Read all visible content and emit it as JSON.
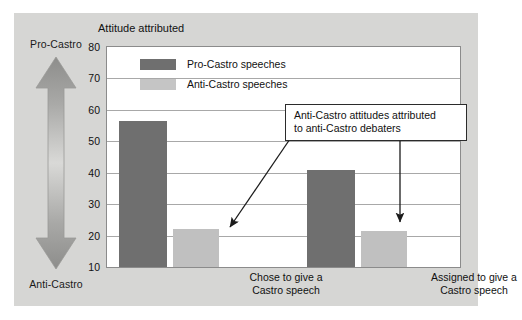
{
  "chart_data": {
    "type": "bar",
    "title": "Attitude attributed",
    "xlabel": "",
    "ylabel": "Attitude attributed",
    "ylim": [
      10,
      80
    ],
    "yticks": [
      10,
      20,
      30,
      40,
      50,
      60,
      70,
      80
    ],
    "grid": true,
    "legend_position": "top-left-inside",
    "categories": [
      "Chose to give a\nCastro speech",
      "Assigned to give a\nCastro speech"
    ],
    "category_lines": [
      [
        "Chose to give a",
        "Castro speech"
      ],
      [
        "Assigned to give a",
        "Castro speech"
      ]
    ],
    "series": [
      {
        "name": "Pro-Castro speeches",
        "color": "#6f6f6f",
        "values": [
          56.5,
          41.0
        ]
      },
      {
        "name": "Anti-Castro speeches",
        "color": "#c0c0c0",
        "values": [
          22.0,
          21.5
        ]
      }
    ],
    "annotations": [
      {
        "text": "Anti-Castro attitudes attributed to anti-Castro debaters",
        "lines": [
          "Anti-Castro attitudes attributed",
          "to anti-Castro debaters"
        ],
        "points_to": [
          "Anti-Castro speeches / Chose to give a Castro speech",
          "Anti-Castro speeches / Assigned to give a Castro speech"
        ]
      }
    ],
    "axis_arrow": {
      "top_label": "Pro-Castro",
      "bottom_label": "Anti-Castro"
    }
  },
  "colors": {
    "panel_background": "#d6d6d4",
    "plot_background": "#ffffff",
    "series_dark": "#6f6f6f",
    "series_light": "#c0c0c0",
    "gridline": "#a8a8a8",
    "callout_border": "#2b2b2b",
    "text": "#111111"
  }
}
